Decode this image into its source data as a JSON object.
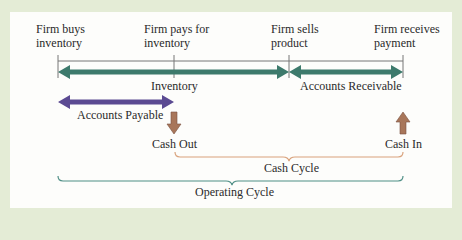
{
  "timeline": {
    "events": [
      {
        "line1": "Firm buys",
        "line2": "inventory"
      },
      {
        "line1": "Firm pays for",
        "line2": "inventory"
      },
      {
        "line1": "Firm sells",
        "line2": "product"
      },
      {
        "line1": "Firm receives",
        "line2": "payment"
      }
    ]
  },
  "periods": {
    "inventory": "Inventory",
    "accounts_receivable": "Accounts Receivable",
    "accounts_payable": "Accounts Payable"
  },
  "cash_flows": {
    "cash_out": "Cash Out",
    "cash_in": "Cash In"
  },
  "cycles": {
    "cash_cycle": "Cash Cycle",
    "operating_cycle": "Operating Cycle"
  },
  "colors": {
    "background": "#e4ecd6",
    "inventory_arrow": "#3d7a6c",
    "payable_arrow": "#5b4a92",
    "cash_arrow": "#a8765a",
    "cash_cycle_brace": "#d9a27c",
    "operating_cycle_brace": "#4f8f86"
  }
}
